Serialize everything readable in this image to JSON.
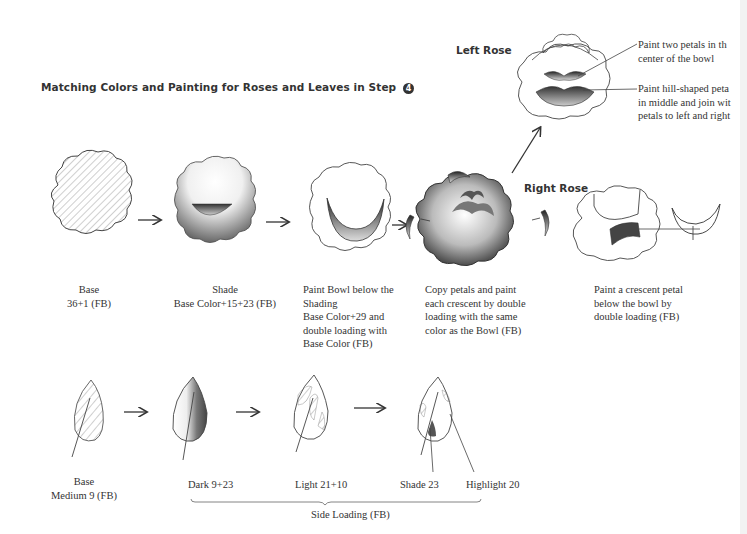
{
  "title": {
    "text": "Matching Colors and Painting for Roses and Leaves in Step",
    "step_number": "4"
  },
  "roses": {
    "left_rose": {
      "heading": "Left Rose",
      "notes": [
        [
          "Paint two petals in th",
          "center of the bowl"
        ],
        [
          "Paint hill-shaped peta",
          "in middle and join wit",
          "petals to left and right"
        ]
      ]
    },
    "right_rose": {
      "heading": "Right Rose"
    },
    "steps": [
      {
        "lines": [
          "Base",
          "36+1 (FB)"
        ]
      },
      {
        "lines": [
          "Shade",
          "Base Color+15+23 (FB)"
        ]
      },
      {
        "lines": [
          "Paint Bowl below the",
          "Shading",
          "Base Color+29 and",
          "double loading with",
          "Base Color (FB)"
        ]
      },
      {
        "lines": [
          "Copy petals and paint",
          "each crescent by double",
          "loading with the same",
          "color as the Bowl (FB)"
        ]
      },
      {
        "lines": [
          "Paint a crescent petal",
          "below the bowl by",
          "double loading (FB)"
        ]
      }
    ]
  },
  "leaves": {
    "base": [
      "Base",
      "Medium   9 (FB)"
    ],
    "dark": "Dark   9+23",
    "light": "Light   21+10",
    "shade": "Shade   23",
    "highlight": "Highlight   20",
    "bracket_label": "Side Loading (FB)"
  },
  "colors": {
    "ink": "#333333",
    "shade": "#555555"
  }
}
